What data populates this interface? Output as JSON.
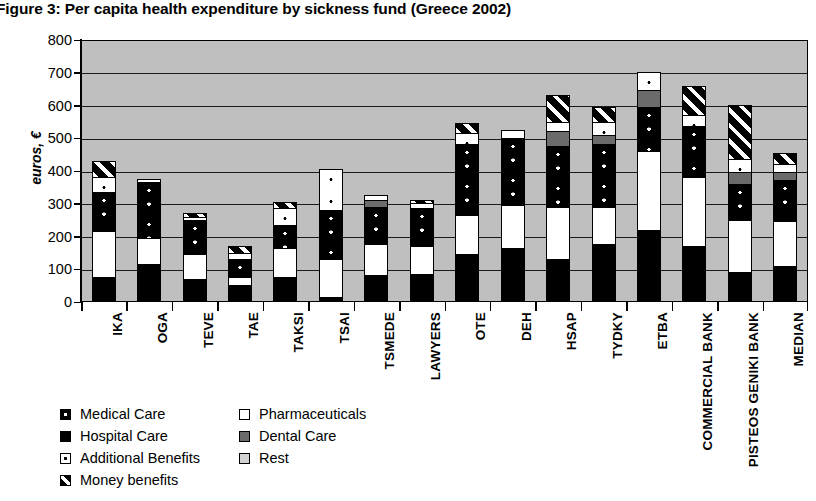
{
  "title": "Figure 3: Per capita health expenditure by sickness fund (Greece 2002)",
  "chart_data": {
    "type": "bar",
    "subtype": "stacked-bar",
    "title": "Figure 3: Per capita health expenditure by sickness fund (Greece 2002)",
    "xlabel": "",
    "ylabel": "euros, €",
    "ylim": [
      0,
      800
    ],
    "ytick_step": 100,
    "yticks": [
      "800",
      "700",
      "600",
      "500",
      "400",
      "300",
      "200",
      "100",
      "0"
    ],
    "grid": true,
    "plot_background": "#bfbfbf",
    "legend_position": "below-left",
    "categories": [
      "IKA",
      "OGA",
      "TEVE",
      "TAE",
      "TAKSI",
      "TSAI",
      "TSMEDE",
      "LAWYERS",
      "OTE",
      "DEH",
      "HSAP",
      "TYDKY",
      "ETBA",
      "COMMERCIAL BANK",
      "PISTEOS GENIKI BANK",
      "MEDIAN"
    ],
    "series": [
      {
        "name": "Hospital Care",
        "fill": "hospital",
        "color": "#000000",
        "values": [
          70,
          110,
          65,
          45,
          70,
          10,
          75,
          80,
          140,
          160,
          125,
          170,
          215,
          165,
          85,
          105
        ]
      },
      {
        "name": "Pharmaceuticals",
        "fill": "pharma",
        "color": "#ffffff",
        "values": [
          140,
          80,
          75,
          25,
          90,
          115,
          95,
          85,
          120,
          130,
          160,
          115,
          240,
          210,
          160,
          135
        ]
      },
      {
        "name": "Medical Care",
        "fill": "medical",
        "color": "#000000",
        "values": [
          120,
          170,
          105,
          55,
          70,
          150,
          115,
          115,
          215,
          205,
          185,
          190,
          135,
          155,
          110,
          125
        ]
      },
      {
        "name": "Dental Care",
        "fill": "dental",
        "color": "#6b6b6b",
        "values": [
          0,
          0,
          0,
          0,
          0,
          0,
          20,
          0,
          0,
          0,
          45,
          30,
          50,
          0,
          35,
          25
        ]
      },
      {
        "name": "Additional Benefits",
        "fill": "additional",
        "color": "#ffffff",
        "values": [
          45,
          10,
          10,
          20,
          50,
          125,
          15,
          15,
          35,
          25,
          30,
          40,
          55,
          35,
          40,
          25
        ]
      },
      {
        "name": "Rest",
        "fill": "rest",
        "color": "#d2d2d2",
        "values": [
          0,
          0,
          0,
          0,
          0,
          0,
          0,
          0,
          0,
          0,
          0,
          0,
          0,
          0,
          0,
          0
        ]
      },
      {
        "name": "Money benefits",
        "fill": "money",
        "color": "#000000",
        "values": [
          50,
          0,
          10,
          20,
          20,
          0,
          0,
          10,
          30,
          0,
          80,
          45,
          0,
          90,
          165,
          35
        ]
      }
    ],
    "totals": [
      425,
      370,
      265,
      165,
      300,
      400,
      320,
      305,
      540,
      520,
      720,
      590,
      695,
      655,
      595,
      450
    ]
  },
  "legend": {
    "items": [
      {
        "label": "Medical Care",
        "fill": "medical",
        "col": 0,
        "row": 0
      },
      {
        "label": "Hospital Care",
        "fill": "hospital",
        "col": 0,
        "row": 1
      },
      {
        "label": "Additional Benefits",
        "fill": "additional",
        "col": 0,
        "row": 2
      },
      {
        "label": "Money benefits",
        "fill": "money",
        "col": 0,
        "row": 3
      },
      {
        "label": "Pharmaceuticals",
        "fill": "pharma",
        "col": 1,
        "row": 0
      },
      {
        "label": "Dental Care",
        "fill": "dental",
        "col": 1,
        "row": 1
      },
      {
        "label": "Rest",
        "fill": "rest",
        "col": 1,
        "row": 2
      }
    ]
  }
}
